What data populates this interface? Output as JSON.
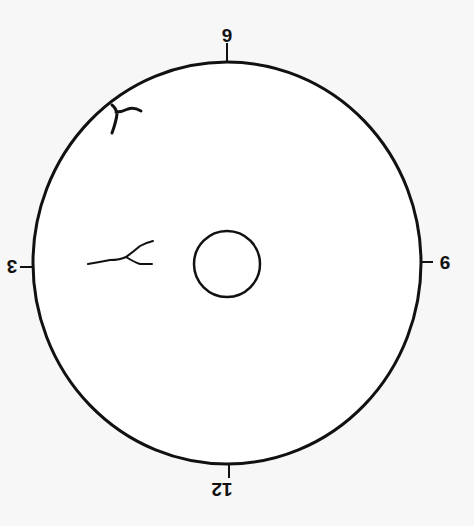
{
  "diagram": {
    "type": "clock-position lesion map (rotated 180°)",
    "labels": {
      "top": "6",
      "right": "9",
      "bottom": "12",
      "left": "3"
    },
    "colors": {
      "background": "#f7f7f7",
      "stroke": "#111111"
    }
  }
}
